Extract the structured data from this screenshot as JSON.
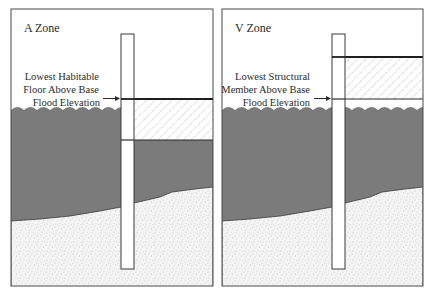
{
  "figure": {
    "colors": {
      "background": "#ffffff",
      "frame": "#4a4a4a",
      "water": "#7b7b7b",
      "soil_base": "#f4f4f4",
      "soil_speckle": "#9a9a9a",
      "hatch": "#a8a8a8",
      "line": "#2a2a2a",
      "text": "#2a2a2a"
    },
    "panels": [
      {
        "id": "a-zone",
        "title": "A Zone",
        "callout_lines": [
          "Lowest Habitable",
          "Floor Above Base",
          "Flood Elevation"
        ],
        "callout_arrow": "→"
      },
      {
        "id": "v-zone",
        "title": "V Zone",
        "callout_lines": [
          "Lowest Structural",
          "Member Above Base",
          "Flood Elevation"
        ],
        "callout_arrow": "→"
      }
    ]
  }
}
